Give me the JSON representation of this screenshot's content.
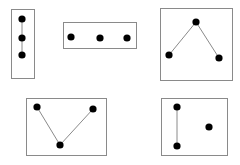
{
  "diagram": {
    "colors": {
      "box": "#8a8a8a",
      "edge": "#8a8a8a",
      "node": "#000000",
      "background": "#ffffff"
    },
    "graphs": [
      {
        "id": "graph-1",
        "box": {
          "x": 11,
          "y": 9,
          "w": 23,
          "h": 69
        },
        "nodes": [
          {
            "x": 22,
            "y": 19
          },
          {
            "x": 22,
            "y": 38
          },
          {
            "x": 22,
            "y": 55
          }
        ],
        "edges": [
          [
            0,
            1
          ],
          [
            1,
            2
          ]
        ]
      },
      {
        "id": "graph-2",
        "box": {
          "x": 63,
          "y": 22,
          "w": 73,
          "h": 26
        },
        "nodes": [
          {
            "x": 71,
            "y": 37
          },
          {
            "x": 100,
            "y": 38
          },
          {
            "x": 127,
            "y": 38
          }
        ],
        "edges": []
      },
      {
        "id": "graph-3",
        "box": {
          "x": 160,
          "y": 8,
          "w": 72,
          "h": 72
        },
        "nodes": [
          {
            "x": 169,
            "y": 55
          },
          {
            "x": 196,
            "y": 22
          },
          {
            "x": 219,
            "y": 58
          }
        ],
        "edges": [
          [
            0,
            1
          ],
          [
            1,
            2
          ]
        ]
      },
      {
        "id": "graph-4",
        "box": {
          "x": 26,
          "y": 98,
          "w": 80,
          "h": 57
        },
        "nodes": [
          {
            "x": 37,
            "y": 107
          },
          {
            "x": 60,
            "y": 145
          },
          {
            "x": 93,
            "y": 109
          }
        ],
        "edges": [
          [
            0,
            1
          ],
          [
            1,
            2
          ]
        ]
      },
      {
        "id": "graph-5",
        "box": {
          "x": 161,
          "y": 98,
          "w": 66,
          "h": 57
        },
        "nodes": [
          {
            "x": 177,
            "y": 107
          },
          {
            "x": 177,
            "y": 146
          },
          {
            "x": 209,
            "y": 127
          }
        ],
        "edges": [
          [
            0,
            1
          ]
        ]
      }
    ]
  }
}
